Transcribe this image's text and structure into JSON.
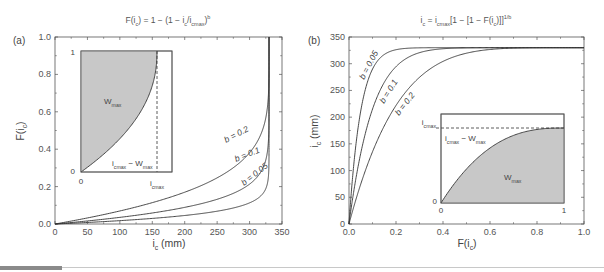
{
  "figure": {
    "panel_a": {
      "label": "(a)",
      "title": "F(i_c) = 1 − (1 − i_c/i_cmax)^b",
      "title_parts": {
        "lhs": "F(i",
        "lhs_sub": "c",
        "lhs_end": ") = 1 − (1 − i",
        "mid_sub": "c",
        "mid": "/i",
        "cmax_sub": "cmax",
        "end": ")",
        "sup": "b"
      },
      "xlabel": "i_c (mm)",
      "xlabel_parts": {
        "main": "i",
        "sub": "c",
        "unit": " (mm)"
      },
      "ylabel": "F(i_c)",
      "ylabel_parts": {
        "main": "F(i",
        "sub": "c",
        "end": ")"
      },
      "x_ticks": [
        "0",
        "50",
        "100",
        "150",
        "200",
        "250",
        "300",
        "350"
      ],
      "y_ticks": [
        "0.0",
        "0.2",
        "0.4",
        "0.6",
        "0.8",
        "1.0"
      ],
      "curve_labels": [
        "b = 0.2",
        "b = 0.1",
        "b = 0.05"
      ],
      "inset": {
        "area_label": "W",
        "area_sub": "max",
        "y_top": "1",
        "y_bottom": "0",
        "x_left": "0",
        "x_right_main": "i",
        "x_right_sub": "cmax",
        "gap_label_main": "i",
        "gap_label_sub1": "cmax",
        "gap_label_mid": " − W",
        "gap_label_sub2": "max"
      }
    },
    "panel_b": {
      "label": "(b)",
      "title": "i_c = i_cmax[1 − [1 − F(i_c)]^(1/b)]",
      "title_parts": {
        "a": "i",
        "a_sub": "c",
        "b": " = i",
        "b_sub": "cmax",
        "c": "[1 − [1 − F(i",
        "c_sub": "c",
        "d": ")]]",
        "sup": "1/b"
      },
      "xlabel": "F(i_c)",
      "xlabel_parts": {
        "main": "F(i",
        "sub": "c",
        "end": ")"
      },
      "ylabel": "i_c (mm)",
      "ylabel_parts": {
        "main": "i",
        "sub": "c",
        "unit": " (mm)"
      },
      "x_ticks": [
        "0.0",
        "0.2",
        "0.4",
        "0.6",
        "0.8",
        "1.0"
      ],
      "y_ticks": [
        "0",
        "50",
        "100",
        "150",
        "200",
        "250",
        "300",
        "350"
      ],
      "curve_labels": [
        "b = 0.05",
        "b = 0.1",
        "b = 0.2"
      ],
      "inset": {
        "area_label": "W",
        "area_sub": "max",
        "y_top_main": "i",
        "y_top_sub": "cmax",
        "y_bottom": "0",
        "x_left": "0",
        "x_right": "1",
        "gap_label_main": "i",
        "gap_label_sub1": "cmax",
        "gap_label_mid": " − W",
        "gap_label_sub2": "max"
      }
    }
  },
  "colors": {
    "curve": "#333333",
    "axis": "#555555",
    "inset_fill": "#c8c8c8",
    "bottom_bar_dark": "#8a8a8a",
    "bottom_bar_line": "#c8c8c8"
  },
  "chart_data": [
    {
      "type": "line",
      "title": "F(i_c) = 1 − (1 − i_c/i_cmax)^b",
      "xlabel": "i_c (mm)",
      "ylabel": "F(i_c)",
      "xlim": [
        0,
        350
      ],
      "ylim": [
        0,
        1.0
      ],
      "x_ticks": [
        0,
        50,
        100,
        150,
        200,
        250,
        300,
        350
      ],
      "y_ticks": [
        0.0,
        0.2,
        0.4,
        0.6,
        0.8,
        1.0
      ],
      "grid": false,
      "i_cmax": 330,
      "x": [
        0,
        50,
        100,
        150,
        200,
        250,
        300,
        320,
        328,
        330
      ],
      "series": [
        {
          "name": "b = 0.2",
          "values": [
            0.0,
            0.032,
            0.069,
            0.115,
            0.171,
            0.248,
            0.374,
            0.506,
            0.654,
            1.0
          ]
        },
        {
          "name": "b = 0.1",
          "values": [
            0.0,
            0.016,
            0.035,
            0.059,
            0.09,
            0.133,
            0.209,
            0.297,
            0.412,
            1.0
          ]
        },
        {
          "name": "b = 0.05",
          "values": [
            0.0,
            0.008,
            0.018,
            0.03,
            0.046,
            0.069,
            0.111,
            0.161,
            0.233,
            1.0
          ]
        }
      ],
      "annotations": [
        "(a)",
        "inset: W_max shaded area, i_cmax − W_max, dashed line at i_cmax"
      ]
    },
    {
      "type": "line",
      "title": "i_c = i_cmax[1 − [1 − F(i_c)]^(1/b)]",
      "xlabel": "F(i_c)",
      "ylabel": "i_c (mm)",
      "xlim": [
        0,
        1.0
      ],
      "ylim": [
        0,
        350
      ],
      "x_ticks": [
        0.0,
        0.2,
        0.4,
        0.6,
        0.8,
        1.0
      ],
      "y_ticks": [
        0,
        50,
        100,
        150,
        200,
        250,
        300,
        350
      ],
      "grid": false,
      "i_cmax": 330,
      "x": [
        0,
        0.05,
        0.1,
        0.2,
        0.3,
        0.4,
        0.6,
        0.8,
        1.0
      ],
      "series": [
        {
          "name": "b = 0.05",
          "values": [
            0,
            211,
            289,
            329,
            330,
            330,
            330,
            330,
            330
          ]
        },
        {
          "name": "b = 0.1",
          "values": [
            0,
            133,
            215,
            294,
            321,
            328,
            330,
            330,
            330
          ]
        },
        {
          "name": "b = 0.2",
          "values": [
            0,
            74,
            135,
            221,
            275,
            305,
            327,
            330,
            330
          ]
        }
      ],
      "annotations": [
        "(b)",
        "inset: W_max shaded area below curve, dashed line at i_cmax"
      ]
    }
  ]
}
